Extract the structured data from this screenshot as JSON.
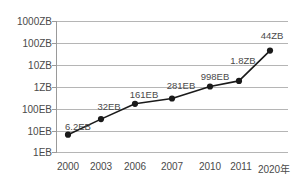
{
  "chart_data": {
    "type": "line",
    "title": "",
    "subtitle": "",
    "xlabel": "",
    "ylabel": "",
    "categories": [
      "2000",
      "2003",
      "2006",
      "2007",
      "2010",
      "2011",
      "2020"
    ],
    "x_tick_labels": [
      "2000",
      "2003",
      "2006",
      "2007",
      "2010",
      "2011",
      "2020年"
    ],
    "y_tick_labels": [
      "1EB",
      "10EB",
      "100EB",
      "1ZB",
      "10ZB",
      "100ZB",
      "1000ZB"
    ],
    "y_tick_values_eb": [
      1,
      10,
      100,
      1000,
      10000,
      100000,
      1000000
    ],
    "yscale": "log",
    "ylim_labels": [
      "1EB",
      "1000ZB"
    ],
    "grid": true,
    "legend": false,
    "point_labels": [
      "6.2EB",
      "32EB",
      "161EB",
      "281EB",
      "998EB",
      "1.8ZB",
      "44ZB"
    ],
    "values_eb": [
      6.2,
      32,
      161,
      281,
      998,
      1800,
      44000
    ],
    "series": [
      {
        "name": "",
        "values": [
          6.2,
          32,
          161,
          281,
          998,
          1800,
          44000
        ],
        "labels": [
          "6.2EB",
          "32EB",
          "161EB",
          "281EB",
          "998EB",
          "1.8ZB",
          "44ZB"
        ]
      }
    ],
    "colors": {
      "line": "#1a1a1a",
      "marker": "#1a1a1a",
      "grid": "#b5b5b5",
      "axis": "#9a9a9a",
      "text": "#4a4a4a",
      "background": "#ffffff"
    }
  }
}
